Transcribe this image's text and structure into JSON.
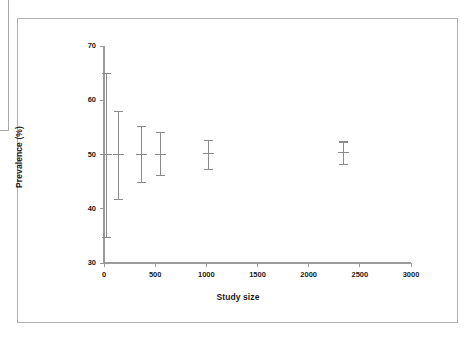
{
  "figure": {
    "background_color": "#ffffff",
    "frame_color": "#b0b0b0",
    "axis_color": "#9a9a9a",
    "marker_color": "#8a8a8a",
    "text_color": "#1a1a1a"
  },
  "chart_data": {
    "type": "scatter",
    "title": "",
    "subtitle": "",
    "xlabel": "Study size",
    "ylabel": "Prevalence (%)",
    "xlim": [
      0,
      3000
    ],
    "ylim": [
      30,
      70
    ],
    "xticks": [
      0,
      500,
      1000,
      1500,
      2000,
      2500,
      3000
    ],
    "yticks": [
      30,
      40,
      50,
      60,
      70
    ],
    "xtick_labels": [
      "0",
      "500",
      "1000",
      "1500",
      "2000",
      "2500",
      "3000"
    ],
    "ytick_labels": [
      "30",
      "40",
      "50",
      "60",
      "70"
    ],
    "grid": false,
    "legend": null,
    "legend_position": "none",
    "error_bar_style": "vertical-capped",
    "series": [
      {
        "name": "Studies",
        "x": [
          25,
          145,
          370,
          555,
          1020,
          2340
        ],
        "y": [
          50.0,
          50.0,
          50.0,
          50.0,
          50.2,
          50.3
        ],
        "y_lower": [
          34.7,
          41.7,
          44.8,
          46.2,
          47.3,
          48.1
        ],
        "y_upper": [
          65.0,
          58.0,
          55.2,
          54.0,
          52.6,
          52.3
        ]
      }
    ],
    "annotations": []
  }
}
